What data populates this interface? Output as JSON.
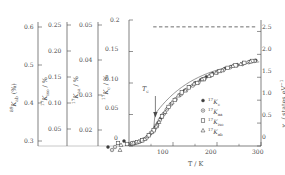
{
  "figure": {
    "background": "#ffffff",
    "ink": "#4a4a4a",
    "marker_color": "#3d3d3d"
  },
  "chart_data": {
    "type": "scatter",
    "title": "",
    "xlabel": "T / K",
    "xlim": [
      0,
      300
    ],
    "xticks": [
      0,
      100,
      200,
      300
    ],
    "xticklabels": [
      "0",
      "100",
      "200",
      "300"
    ],
    "grid": false,
    "legend_position": "inside-lower-right",
    "annotations": [
      {
        "name": "tc-arrow",
        "label": "T",
        "sub": "c",
        "x": 60,
        "note": "downward arrow marking superconducting transition"
      },
      {
        "name": "saturation-dashed-line",
        "style": "dashed",
        "y_right": 2.6,
        "x_from": 55,
        "x_to": 290
      }
    ],
    "axes": [
      {
        "id": "axis-89Kab",
        "label_pre": "",
        "label_sup": "89",
        "label_main": "K",
        "label_sub": "ab",
        "label_post": " (%)",
        "lim": [
          0.3,
          0.6
        ],
        "ticks": [
          0.3,
          0.4,
          0.5,
          0.6
        ],
        "ticklabels": [
          "0.3",
          "0.4",
          "0.5",
          "0.6"
        ]
      },
      {
        "id": "axis-17Kiso",
        "label_sup": "17",
        "label_main": "K",
        "label_sub": "iso",
        "label_post": " / %",
        "lim": [
          0.025,
          0.27
        ],
        "ticks": [
          0.05,
          0.1,
          0.15,
          0.2,
          0.25
        ],
        "ticklabels": [
          "0.05",
          "0.10",
          "0.15",
          "0.20",
          "0.25"
        ]
      },
      {
        "id": "axis-17Kaa",
        "label_sup": "17",
        "label_main": "K",
        "label_sub": "aa",
        "label_post": " / %",
        "lim": [
          0.013,
          0.054
        ],
        "ticks": [
          0.02,
          0.03,
          0.04,
          0.05
        ],
        "ticklabels": [
          "0.02",
          "0.03",
          "0.04",
          "0.05"
        ]
      },
      {
        "id": "axis-17Kc",
        "label_sup": "17",
        "label_main": "K",
        "label_sub": "c",
        "label_post": " / %",
        "lim": [
          0.0,
          0.2
        ],
        "ticks": [
          0,
          0.05,
          0.1,
          0.15,
          0.2
        ],
        "ticklabels": [
          "0",
          "0.05",
          "0.10",
          "0.15",
          "0.2"
        ]
      },
      {
        "id": "axis-chi-s",
        "side": "right",
        "label_main": "χ",
        "label_sub": "s",
        "label_post": " / states eV",
        "label_exp": "−1",
        "lim": [
          0,
          2.75
        ],
        "ticks": [
          0,
          0.5,
          1.0,
          1.5,
          2.0,
          2.5
        ],
        "ticklabels": [
          "0",
          "0.5",
          "1.0",
          "1.5",
          "2.0",
          "2.5"
        ]
      }
    ],
    "legend": [
      {
        "marker": "filled-circle",
        "sup": "17",
        "main": "K",
        "sub": "c"
      },
      {
        "marker": "dotted-circle",
        "sup": "17",
        "main": "K",
        "sub": "aa"
      },
      {
        "marker": "open-square",
        "sup": "17",
        "main": "K",
        "sub": "iso"
      },
      {
        "marker": "open-triangle",
        "sup": "17",
        "main": "K",
        "sub": "ab"
      }
    ],
    "series": [
      {
        "name": "17Kc",
        "marker": "filled-circle",
        "x": [
          5,
          12,
          20,
          28,
          35,
          42,
          48,
          55,
          60,
          66,
          72,
          80,
          88,
          96,
          105,
          115,
          126,
          138,
          150,
          163,
          176,
          190,
          204,
          218,
          232,
          246,
          260,
          274,
          288
        ],
        "y": [
          0.003,
          0.004,
          0.006,
          0.008,
          0.011,
          0.015,
          0.019,
          0.024,
          0.03,
          0.037,
          0.044,
          0.052,
          0.06,
          0.067,
          0.074,
          0.081,
          0.088,
          0.094,
          0.1,
          0.105,
          0.11,
          0.115,
          0.119,
          0.123,
          0.126,
          0.129,
          0.132,
          0.134,
          0.136
        ]
      },
      {
        "name": "17Kaa",
        "marker": "dotted-circle",
        "x": [
          6,
          15,
          24,
          32,
          40,
          50,
          58,
          64,
          70,
          78,
          86,
          95,
          106,
          118,
          130,
          145,
          158,
          172,
          186,
          200,
          215,
          230,
          245,
          258,
          272,
          286
        ],
        "y": [
          0.004,
          0.005,
          0.007,
          0.01,
          0.013,
          0.021,
          0.027,
          0.033,
          0.041,
          0.05,
          0.058,
          0.066,
          0.074,
          0.082,
          0.089,
          0.096,
          0.101,
          0.107,
          0.112,
          0.117,
          0.121,
          0.125,
          0.128,
          0.13,
          0.133,
          0.135
        ]
      },
      {
        "name": "17Kiso",
        "marker": "open-square",
        "x": [
          8,
          18,
          30,
          45,
          56,
          63,
          75,
          90,
          104,
          120,
          136,
          155,
          170,
          188,
          206,
          224,
          242,
          262,
          280
        ],
        "y": [
          0.004,
          0.006,
          0.009,
          0.017,
          0.025,
          0.032,
          0.047,
          0.062,
          0.073,
          0.085,
          0.093,
          0.1,
          0.106,
          0.113,
          0.119,
          0.124,
          0.128,
          0.132,
          0.135
        ]
      },
      {
        "name": "17Kab",
        "marker": "open-triangle",
        "x": [
          10,
          22,
          36,
          52,
          62,
          68,
          82,
          98,
          112,
          128,
          148,
          166,
          182,
          198,
          212,
          236,
          254,
          276
        ],
        "y": [
          0.005,
          0.007,
          0.011,
          0.022,
          0.031,
          0.038,
          0.054,
          0.069,
          0.08,
          0.088,
          0.099,
          0.106,
          0.111,
          0.116,
          0.12,
          0.127,
          0.13,
          0.134
        ]
      }
    ]
  }
}
